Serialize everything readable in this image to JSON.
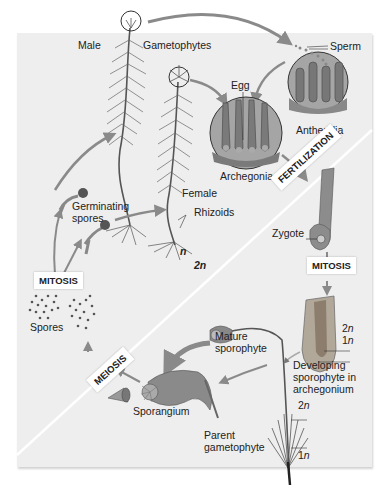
{
  "diagram": {
    "labels": {
      "male": "Male",
      "gametophytes": "Gametophytes",
      "sperm": "Sperm",
      "egg": "Egg",
      "antheridia": "Antheridia",
      "archegonia": "Archegonia",
      "female": "Female",
      "rhizoids": "Rhizoids",
      "germinating_spores": "Germinating\nspores",
      "germinating_line1": "Germinating",
      "germinating_line2": "spores",
      "spores": "Spores",
      "zygote": "Zygote",
      "mature_sporophyte_line1": "Mature",
      "mature_sporophyte_line2": "sporophyte",
      "sporangium": "Sporangium",
      "developing_line1": "Developing",
      "developing_line2": "sporophyte in",
      "developing_line3": "archegonium",
      "parent_line1": "Parent",
      "parent_line2": "gametophyte"
    },
    "process_boxes": {
      "fertilization": "FERTILIZATION",
      "mitosis_top": "MITOSIS",
      "mitosis_left": "MITOSIS",
      "meiosis": "MEIOSIS"
    },
    "ploidy": {
      "haploid": "n",
      "diploid": "2n",
      "dev_2n": "2",
      "dev_1n": "1",
      "stalk_2n": "2",
      "stalk_1n": "1",
      "suffix": "n"
    },
    "colors": {
      "panel": "#eeeeee",
      "divider": "#ffffff",
      "plant": "#5a5a5a",
      "arrow": "#8a8a8a",
      "circle_fill": "#9a9a9a"
    }
  }
}
